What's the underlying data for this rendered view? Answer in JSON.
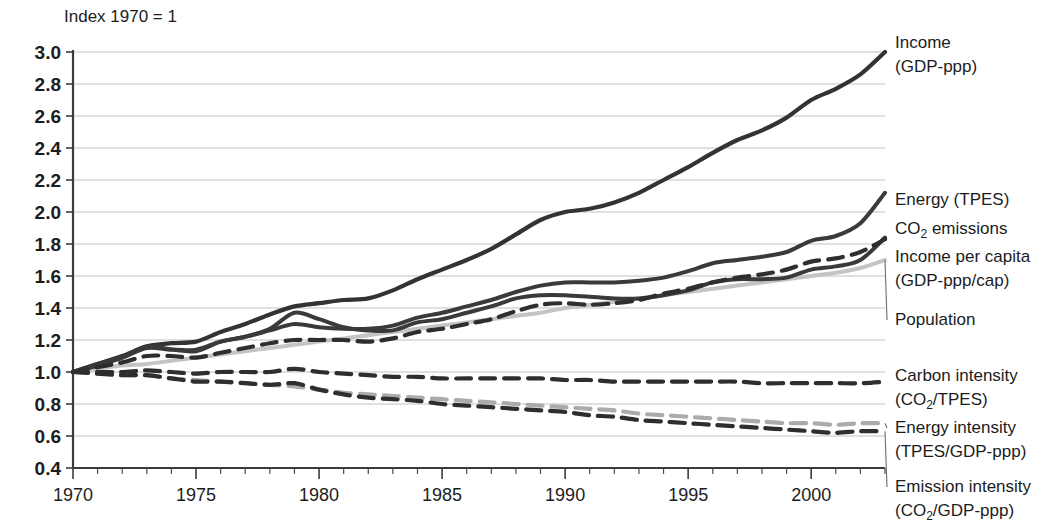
{
  "chart_data": {
    "type": "line",
    "title": "Index 1970 = 1",
    "xlabel": "",
    "ylabel": "",
    "xlim": [
      1970,
      2003
    ],
    "ylim": [
      0.4,
      3.0
    ],
    "ytick_step": 0.2,
    "grid": true,
    "legend_position": "right-inline-labels",
    "x": [
      1970,
      1971,
      1972,
      1973,
      1974,
      1975,
      1976,
      1977,
      1978,
      1979,
      1980,
      1981,
      1982,
      1983,
      1984,
      1985,
      1986,
      1987,
      1988,
      1989,
      1990,
      1991,
      1992,
      1993,
      1994,
      1995,
      1996,
      1997,
      1998,
      1999,
      2000,
      2001,
      2002,
      2003
    ],
    "xticks": [
      1970,
      1975,
      1980,
      1985,
      1990,
      1995,
      2000
    ],
    "xtick_labels": [
      "1970",
      "1975",
      "1980",
      "1985",
      "1990",
      "1995",
      "2000"
    ],
    "yticks": [
      0.4,
      0.6,
      0.8,
      1.0,
      1.2,
      1.4,
      1.6,
      1.8,
      2.0,
      2.2,
      2.4,
      2.6,
      2.8,
      3.0
    ],
    "ytick_labels": [
      "0.4",
      "0.6",
      "0.8",
      "1.0",
      "1.2",
      "1.4",
      "1.6",
      "1.8",
      "2.0",
      "2.2",
      "2.4",
      "2.6",
      "2.8",
      "3.0"
    ],
    "series": [
      {
        "name": "Income (GDP-ppp)",
        "label_line1": "Income",
        "label_line2": "(GDP-ppp)",
        "color": "#333333",
        "width": 4.2,
        "dash": "none",
        "values": [
          1.0,
          1.05,
          1.1,
          1.16,
          1.18,
          1.19,
          1.25,
          1.3,
          1.36,
          1.41,
          1.43,
          1.45,
          1.46,
          1.51,
          1.58,
          1.64,
          1.7,
          1.77,
          1.86,
          1.95,
          2.0,
          2.02,
          2.06,
          2.12,
          2.2,
          2.28,
          2.37,
          2.45,
          2.51,
          2.59,
          2.7,
          2.77,
          2.86,
          3.0
        ]
      },
      {
        "name": "Energy (TPES)",
        "label_line1": "Energy (TPES)",
        "label_line2": "",
        "color": "#3a3a3a",
        "width": 4.0,
        "dash": "none",
        "values": [
          1.0,
          1.05,
          1.09,
          1.15,
          1.14,
          1.14,
          1.19,
          1.22,
          1.26,
          1.3,
          1.28,
          1.27,
          1.27,
          1.29,
          1.34,
          1.37,
          1.41,
          1.45,
          1.5,
          1.54,
          1.56,
          1.56,
          1.56,
          1.57,
          1.59,
          1.63,
          1.68,
          1.7,
          1.72,
          1.75,
          1.82,
          1.85,
          1.93,
          2.12
        ]
      },
      {
        "name": "CO2 emissions",
        "label_line1": "CO",
        "label_sub": "2",
        "label_line1_tail": " emissions",
        "label_line2": "",
        "color": "#3a3a3a",
        "width": 4.0,
        "dash": "none",
        "values": [
          1.0,
          1.04,
          1.09,
          1.16,
          1.14,
          1.13,
          1.19,
          1.22,
          1.27,
          1.37,
          1.33,
          1.28,
          1.26,
          1.26,
          1.31,
          1.33,
          1.37,
          1.41,
          1.46,
          1.48,
          1.48,
          1.47,
          1.46,
          1.46,
          1.48,
          1.51,
          1.56,
          1.58,
          1.58,
          1.59,
          1.64,
          1.66,
          1.7,
          1.84
        ]
      },
      {
        "name": "Income per capita (GDP-ppp/cap)",
        "label_line1": "Income per capita",
        "label_line2": "(GDP-ppp/cap)",
        "color": "#2e2e2e",
        "width": 4.2,
        "dash": "15,9",
        "values": [
          1.0,
          1.03,
          1.06,
          1.1,
          1.1,
          1.09,
          1.12,
          1.15,
          1.18,
          1.2,
          1.2,
          1.2,
          1.19,
          1.21,
          1.25,
          1.27,
          1.3,
          1.33,
          1.38,
          1.42,
          1.43,
          1.42,
          1.43,
          1.45,
          1.49,
          1.52,
          1.56,
          1.59,
          1.61,
          1.64,
          1.69,
          1.71,
          1.75,
          1.83
        ]
      },
      {
        "name": "Population",
        "label_line1": "Population",
        "label_line2": "",
        "color": "#c4c4c4",
        "width": 4.0,
        "dash": "none",
        "values": [
          1.0,
          1.02,
          1.04,
          1.05,
          1.07,
          1.09,
          1.11,
          1.13,
          1.15,
          1.17,
          1.19,
          1.21,
          1.23,
          1.25,
          1.27,
          1.29,
          1.31,
          1.33,
          1.35,
          1.37,
          1.4,
          1.42,
          1.44,
          1.46,
          1.48,
          1.5,
          1.52,
          1.54,
          1.56,
          1.58,
          1.6,
          1.62,
          1.65,
          1.7
        ]
      },
      {
        "name": "Carbon intensity (CO2/TPES)",
        "label_line1": "Carbon intensity",
        "label_line2": "(CO",
        "label_sub2": "2",
        "label_line2_tail": "/TPES)",
        "color": "#2e2e2e",
        "width": 4.2,
        "dash": "15,9",
        "values": [
          1.0,
          1.0,
          1.0,
          1.01,
          1.0,
          0.99,
          1.0,
          1.0,
          1.0,
          1.02,
          1.0,
          0.99,
          0.98,
          0.97,
          0.97,
          0.96,
          0.96,
          0.96,
          0.96,
          0.96,
          0.95,
          0.95,
          0.94,
          0.94,
          0.94,
          0.94,
          0.94,
          0.94,
          0.93,
          0.93,
          0.93,
          0.93,
          0.93,
          0.94
        ]
      },
      {
        "name": "Energy intensity (TPES/GDP-ppp)",
        "label_line1": "Energy intensity",
        "label_line2": "(TPES/GDP-ppp)",
        "color": "#ababab",
        "width": 4.2,
        "dash": "15,9",
        "values": [
          1.0,
          0.99,
          0.98,
          0.98,
          0.96,
          0.95,
          0.94,
          0.93,
          0.92,
          0.91,
          0.89,
          0.87,
          0.86,
          0.85,
          0.84,
          0.83,
          0.82,
          0.81,
          0.8,
          0.79,
          0.78,
          0.77,
          0.76,
          0.74,
          0.73,
          0.72,
          0.71,
          0.7,
          0.69,
          0.68,
          0.68,
          0.67,
          0.68,
          0.68
        ]
      },
      {
        "name": "Emission intensity (CO2/GDP-ppp)",
        "label_line1": "Emission intensity",
        "label_line2": "(CO",
        "label_sub2": "2",
        "label_line2_tail": "/GDP-ppp)",
        "color": "#2e2e2e",
        "width": 4.2,
        "dash": "15,9",
        "values": [
          1.0,
          0.99,
          0.98,
          0.98,
          0.96,
          0.94,
          0.94,
          0.93,
          0.92,
          0.93,
          0.89,
          0.86,
          0.84,
          0.83,
          0.82,
          0.8,
          0.79,
          0.78,
          0.77,
          0.76,
          0.75,
          0.73,
          0.72,
          0.7,
          0.69,
          0.68,
          0.67,
          0.66,
          0.65,
          0.64,
          0.63,
          0.62,
          0.63,
          0.63
        ]
      }
    ]
  },
  "legend_labels": {
    "income": {
      "line1": "Income",
      "line2": "(GDP-ppp)"
    },
    "energy": {
      "line1": "Energy (TPES)",
      "line2": ""
    },
    "co2": {
      "pre": "CO",
      "sub": "2",
      "post": " emissions"
    },
    "income_per_capita": {
      "line1": "Income per capita",
      "line2": "(GDP-ppp/cap)"
    },
    "population": {
      "line1": "Population",
      "line2": ""
    },
    "carbon_intensity": {
      "line1": "Carbon intensity",
      "pre2": "(CO",
      "sub2": "2",
      "post2": "/TPES)"
    },
    "energy_intensity": {
      "line1": "Energy intensity",
      "line2": "(TPES/GDP-ppp)"
    },
    "emission_intensity": {
      "line1": "Emission intensity",
      "pre2": "(CO",
      "sub2": "2",
      "post2": "/GDP-ppp)"
    }
  },
  "colors": {
    "dark": "#333333",
    "mid_gray": "#ababab",
    "light_gray": "#c4c4c4",
    "grid": "#b9b9b9",
    "axis": "#3b3b3b",
    "text": "#1c1c1c",
    "background": "#ffffff"
  }
}
